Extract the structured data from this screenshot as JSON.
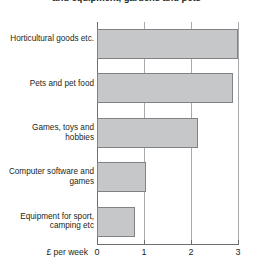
{
  "chart_data": {
    "type": "bar",
    "orientation": "horizontal",
    "title": "and equipment, gardens and pets",
    "categories": [
      "Horticultural goods etc.",
      "Pets and pet food",
      "Games, toys and hobbies",
      "Computer software and games",
      "Equipment for sport, camping etc"
    ],
    "values": [
      3.0,
      2.9,
      2.15,
      1.05,
      0.8
    ],
    "xlabel": "£ per week",
    "ylabel": "",
    "xlim": [
      0,
      3
    ],
    "xticks": [
      "0",
      "1",
      "2",
      "3"
    ],
    "xtick_values": [
      0,
      1,
      2,
      3
    ],
    "grid": true,
    "grid_axis": "x",
    "legend": false,
    "bar_color": "#c6c7c8",
    "bar_border_color": "#808285",
    "axis_color": "#6d6e71",
    "grid_color": "#a7a9ac",
    "text_color": "#231f20"
  }
}
